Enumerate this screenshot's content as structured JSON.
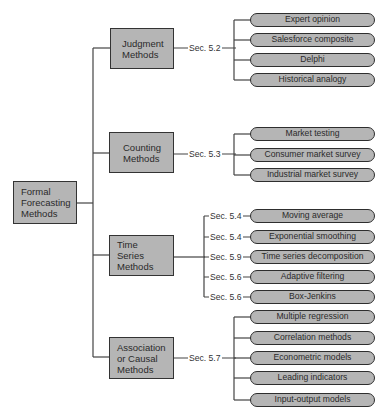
{
  "root": {
    "label_lines": [
      "Formal",
      "Forecasting",
      "Methods"
    ]
  },
  "categories": [
    {
      "label_lines": [
        "Judgment",
        "Methods"
      ],
      "section": "Sec. 5.2",
      "methods": [
        "Expert opinion",
        "Salesforce composite",
        "Delphi",
        "Historical analogy"
      ]
    },
    {
      "label_lines": [
        "Counting",
        "Methods"
      ],
      "section": "Sec. 5.3",
      "methods": [
        "Market testing",
        "Consumer market survey",
        "Industrial market survey"
      ]
    },
    {
      "label_lines": [
        "Time Series",
        "Methods"
      ],
      "methods": [
        {
          "label": "Moving average",
          "section": "Sec. 5.4"
        },
        {
          "label": "Exponential smoothing",
          "section": "Sec. 5.4"
        },
        {
          "label": "Time series decomposition",
          "section": "Sec. 5.9"
        },
        {
          "label": "Adaptive filtering",
          "section": "Sec. 5.6"
        },
        {
          "label": "Box-Jenkins",
          "section": "Sec. 5.6"
        }
      ]
    },
    {
      "label_lines": [
        "Association",
        "or Causal",
        "Methods"
      ],
      "section": "Sec. 5.7",
      "methods": [
        "Multiple regression",
        "Correlation methods",
        "Econometric models",
        "Leading indicators",
        "Input-output models"
      ]
    }
  ]
}
